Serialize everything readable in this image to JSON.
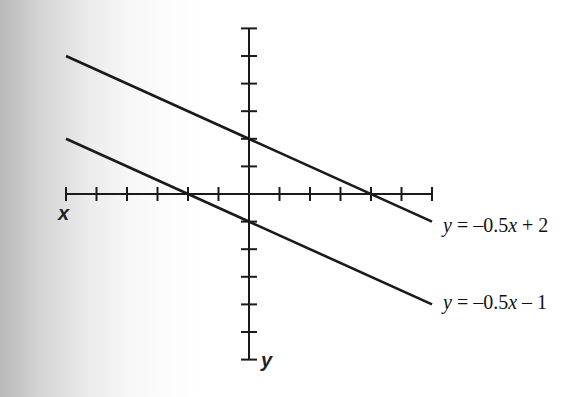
{
  "chart_data": {
    "type": "line",
    "title": "",
    "xlabel": "x",
    "ylabel": "y",
    "xlim": [
      -6,
      6
    ],
    "ylim": [
      -6,
      6
    ],
    "x_ticks": [
      -6,
      -5,
      -4,
      -3,
      -2,
      -1,
      0,
      1,
      2,
      3,
      4,
      5,
      6
    ],
    "y_ticks": [
      -6,
      -5,
      -4,
      -3,
      -2,
      -1,
      0,
      1,
      2,
      3,
      4,
      5,
      6
    ],
    "tick_labels_shown": false,
    "grid": false,
    "series": [
      {
        "name": "y = -0.5x + 2",
        "slope": -0.5,
        "intercept": 2,
        "x": [
          -6,
          6
        ],
        "values": [
          5,
          -1
        ]
      },
      {
        "name": "y = -0.5x - 1",
        "slope": -0.5,
        "intercept": -1,
        "x": [
          -6,
          6
        ],
        "values": [
          2,
          -4
        ]
      }
    ],
    "annotations": [
      {
        "text": "y = -0.5x + 2",
        "attached_to": "series 1 right end"
      },
      {
        "text": "y = -0.5x - 1",
        "attached_to": "series 2 right end"
      }
    ]
  },
  "labels": {
    "x_axis": "x",
    "y_axis": "y",
    "eq1": {
      "y": "y",
      "eq": " = –0.5",
      "x": "x",
      "rest": " + 2"
    },
    "eq2": {
      "y": "y",
      "eq": " = –0.5",
      "x": "x",
      "rest": " – 1"
    }
  },
  "colors": {
    "ink": "#1a1a1a"
  }
}
